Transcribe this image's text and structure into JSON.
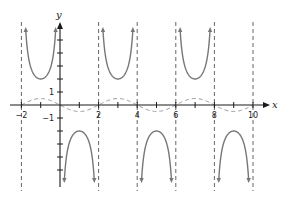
{
  "chart_data": {
    "type": "line",
    "title": "",
    "xlabel": "x",
    "ylabel": "y",
    "xlim": [
      -2.6,
      11
    ],
    "ylim": [
      -6.3,
      6.3
    ],
    "x_ticks": [
      -2,
      -1,
      1,
      2,
      3,
      4,
      5,
      6,
      7,
      8,
      9,
      10
    ],
    "x_tick_labels": [
      "-2",
      "2",
      "4",
      "6",
      "8",
      "10"
    ],
    "x_tick_label_values": [
      -2,
      2,
      4,
      6,
      8,
      10
    ],
    "y_ticks": [
      -5,
      -4,
      -3,
      -2,
      -1,
      1,
      2,
      3,
      4,
      5
    ],
    "y_tick_labels": [
      "1",
      "-1"
    ],
    "y_tick_label_values": [
      1,
      -1
    ],
    "grid": false,
    "asymptotes_x": [
      -2,
      2,
      4,
      6,
      8,
      10
    ],
    "series": [
      {
        "name": "y = -2 csc(πx/2)",
        "style": "solid",
        "color": "#777777",
        "branches": [
          {
            "interval": [
              -2,
              0
            ],
            "direction": "up",
            "extremum": {
              "x": -1,
              "y": 2
            }
          },
          {
            "interval": [
              0,
              2
            ],
            "direction": "down",
            "extremum": {
              "x": 1,
              "y": -2
            }
          },
          {
            "interval": [
              2,
              4
            ],
            "direction": "up",
            "extremum": {
              "x": 3,
              "y": 2
            }
          },
          {
            "interval": [
              4,
              6
            ],
            "direction": "down",
            "extremum": {
              "x": 5,
              "y": -2
            }
          },
          {
            "interval": [
              6,
              8
            ],
            "direction": "up",
            "extremum": {
              "x": 7,
              "y": 2
            }
          },
          {
            "interval": [
              8,
              10
            ],
            "direction": "down",
            "extremum": {
              "x": 9,
              "y": -2
            }
          }
        ]
      },
      {
        "name": "y = -0.5 sin(πx/2)",
        "style": "dashed",
        "color": "#999999",
        "x": [
          -2,
          -1,
          0,
          1,
          2,
          3,
          4,
          5,
          6,
          7,
          8,
          9,
          10
        ],
        "values": [
          0,
          0.5,
          0,
          -0.5,
          0,
          0.5,
          0,
          -0.5,
          0,
          0.5,
          0,
          -0.5,
          0
        ]
      }
    ],
    "colors": {
      "axis": "#1a1a1a",
      "curve": "#777777",
      "sine": "#9a9a9a",
      "asymptote": "#666666"
    }
  }
}
